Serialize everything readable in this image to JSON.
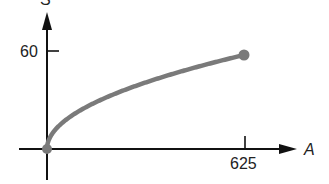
{
  "chart_data": {
    "type": "line",
    "title": "",
    "function": "S = 2.4 * sqrt(A)",
    "xlabel": "A",
    "ylabel": "S",
    "x_ticks": [
      625
    ],
    "y_ticks": [
      60
    ],
    "x": [
      0,
      25,
      100,
      225,
      400,
      625
    ],
    "values": [
      0,
      12,
      24,
      36,
      48,
      60
    ],
    "endpoints": [
      {
        "x": 0,
        "y": 0,
        "marker": "filled"
      },
      {
        "x": 625,
        "y": 60,
        "marker": "filled"
      }
    ],
    "grid": false,
    "series_color": "#7a7a7a"
  },
  "labels": {
    "y_axis": "S",
    "x_axis": "A",
    "y_tick": "60",
    "x_tick": "625"
  }
}
